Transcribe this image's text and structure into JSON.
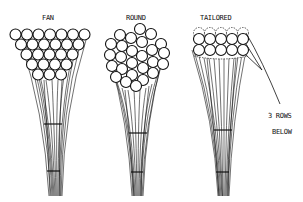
{
  "diagram": {
    "panels": [
      {
        "id": "fan",
        "label": "FAN",
        "rows": [
          7,
          6,
          5,
          4,
          3
        ]
      },
      {
        "id": "round",
        "label": "ROUND"
      },
      {
        "id": "tailored",
        "label": "TAILORED",
        "visible_rows": 2,
        "hidden_rows": 3
      }
    ],
    "annotation": {
      "line1": "3 ROWS",
      "line2": "BELOW"
    },
    "colors": {
      "ink": "#111111",
      "paper": "#ffffff"
    }
  }
}
